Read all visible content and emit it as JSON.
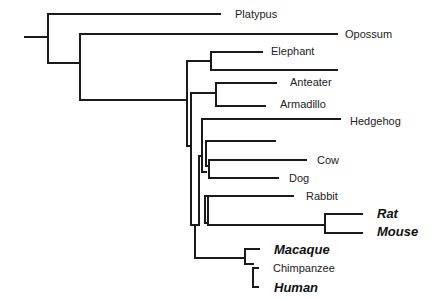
{
  "tree": {
    "title": "",
    "line_color": "#1a1a1a",
    "leaves": [
      {
        "name": "Platypus",
        "x": 235,
        "y": 14,
        "style": "normal"
      },
      {
        "name": "Opossum",
        "x": 345,
        "y": 34,
        "style": "normal"
      },
      {
        "name": "Elephant",
        "x": 271,
        "y": 51,
        "style": "normal"
      },
      {
        "name": "Anteater",
        "x": 290,
        "y": 82,
        "style": "normal"
      },
      {
        "name": "Armadillo",
        "x": 280,
        "y": 104,
        "style": "normal"
      },
      {
        "name": "Hedgehog",
        "x": 350,
        "y": 121,
        "style": "normal"
      },
      {
        "name": "Cow",
        "x": 317,
        "y": 160,
        "style": "normal"
      },
      {
        "name": "Dog",
        "x": 289,
        "y": 178,
        "style": "normal"
      },
      {
        "name": "Rabbit",
        "x": 306,
        "y": 196,
        "style": "normal"
      },
      {
        "name": "Rat",
        "x": 377,
        "y": 213,
        "style": "bold"
      },
      {
        "name": "Mouse",
        "x": 377,
        "y": 231,
        "style": "bold"
      },
      {
        "name": "Macaque",
        "x": 274,
        "y": 249,
        "style": "bold"
      },
      {
        "name": "Chimpanzee",
        "x": 273,
        "y": 268,
        "style": "normal"
      },
      {
        "name": "Human",
        "x": 274,
        "y": 287,
        "style": "bold"
      }
    ]
  }
}
